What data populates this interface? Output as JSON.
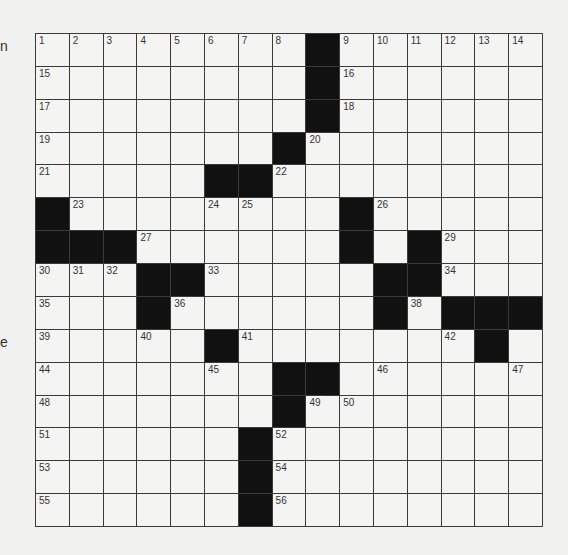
{
  "margin": {
    "top_fragment": "n",
    "middle_fragment": "e"
  },
  "colors": {
    "background": "#f1f1f0",
    "cell": "#f4f4f3",
    "block": "#111111",
    "grid_line": "#3a3a3a",
    "number": "#333333"
  },
  "puzzle": {
    "rows": 15,
    "cols": 15,
    "grid": [
      "........#......",
      "........#......",
      "........#......",
      ".......#.......",
      ".....##........",
      "#........#.....",
      "###......#.#...",
      "...##.....##...",
      "...#......#.###",
      ".....#.......#.",
      ".......##......",
      ".......#.......",
      "......#........",
      "......#........",
      "......#........"
    ],
    "numbers": [
      {
        "row": 0,
        "col": 0,
        "n": "1"
      },
      {
        "row": 0,
        "col": 1,
        "n": "2"
      },
      {
        "row": 0,
        "col": 2,
        "n": "3"
      },
      {
        "row": 0,
        "col": 3,
        "n": "4"
      },
      {
        "row": 0,
        "col": 4,
        "n": "5"
      },
      {
        "row": 0,
        "col": 5,
        "n": "6"
      },
      {
        "row": 0,
        "col": 6,
        "n": "7"
      },
      {
        "row": 0,
        "col": 7,
        "n": "8"
      },
      {
        "row": 0,
        "col": 9,
        "n": "9"
      },
      {
        "row": 0,
        "col": 10,
        "n": "10"
      },
      {
        "row": 0,
        "col": 11,
        "n": "11"
      },
      {
        "row": 0,
        "col": 12,
        "n": "12"
      },
      {
        "row": 0,
        "col": 13,
        "n": "13"
      },
      {
        "row": 0,
        "col": 14,
        "n": "14"
      },
      {
        "row": 1,
        "col": 0,
        "n": "15"
      },
      {
        "row": 1,
        "col": 9,
        "n": "16"
      },
      {
        "row": 2,
        "col": 0,
        "n": "17"
      },
      {
        "row": 2,
        "col": 9,
        "n": "18"
      },
      {
        "row": 3,
        "col": 0,
        "n": "19"
      },
      {
        "row": 3,
        "col": 8,
        "n": "20"
      },
      {
        "row": 4,
        "col": 0,
        "n": "21"
      },
      {
        "row": 4,
        "col": 7,
        "n": "22"
      },
      {
        "row": 5,
        "col": 1,
        "n": "23"
      },
      {
        "row": 5,
        "col": 5,
        "n": "24"
      },
      {
        "row": 5,
        "col": 6,
        "n": "25"
      },
      {
        "row": 5,
        "col": 10,
        "n": "26"
      },
      {
        "row": 6,
        "col": 3,
        "n": "27"
      },
      {
        "row": 6,
        "col": 9,
        "n": "28"
      },
      {
        "row": 6,
        "col": 12,
        "n": "29"
      },
      {
        "row": 7,
        "col": 0,
        "n": "30"
      },
      {
        "row": 7,
        "col": 1,
        "n": "31"
      },
      {
        "row": 7,
        "col": 2,
        "n": "32"
      },
      {
        "row": 7,
        "col": 5,
        "n": "33"
      },
      {
        "row": 7,
        "col": 12,
        "n": "34"
      },
      {
        "row": 8,
        "col": 0,
        "n": "35"
      },
      {
        "row": 8,
        "col": 4,
        "n": "36"
      },
      {
        "row": 8,
        "col": 10,
        "n": "37"
      },
      {
        "row": 8,
        "col": 11,
        "n": "38"
      },
      {
        "row": 9,
        "col": 0,
        "n": "39"
      },
      {
        "row": 9,
        "col": 3,
        "n": "40"
      },
      {
        "row": 9,
        "col": 6,
        "n": "41"
      },
      {
        "row": 9,
        "col": 12,
        "n": "42"
      },
      {
        "row": 9,
        "col": 13,
        "n": "43"
      },
      {
        "row": 10,
        "col": 0,
        "n": "44"
      },
      {
        "row": 10,
        "col": 5,
        "n": "45"
      },
      {
        "row": 10,
        "col": 10,
        "n": "46"
      },
      {
        "row": 10,
        "col": 14,
        "n": "47"
      },
      {
        "row": 11,
        "col": 0,
        "n": "48"
      },
      {
        "row": 11,
        "col": 8,
        "n": "49"
      },
      {
        "row": 11,
        "col": 9,
        "n": "50"
      },
      {
        "row": 12,
        "col": 0,
        "n": "51"
      },
      {
        "row": 12,
        "col": 7,
        "n": "52"
      },
      {
        "row": 13,
        "col": 0,
        "n": "53"
      },
      {
        "row": 13,
        "col": 7,
        "n": "54"
      },
      {
        "row": 14,
        "col": 0,
        "n": "55"
      },
      {
        "row": 14,
        "col": 7,
        "n": "56"
      }
    ]
  }
}
